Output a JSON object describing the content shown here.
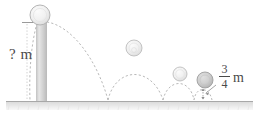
{
  "figure": {
    "type": "physics-diagram",
    "labels": {
      "drop_height": "? m",
      "drop_height_text": "?",
      "drop_height_unit": "m",
      "bounce_height_numerator": "3",
      "bounce_height_denominator": "4",
      "bounce_height_unit": "m"
    },
    "colors": {
      "ball_fill": "#f2f2f2",
      "ball_fill_dark": "#c9c9c9",
      "ball_stroke": "#b5b5b5",
      "column_fill": "#d4d4d4",
      "ground_line": "#a8a8a8",
      "trajectory": "#b0b0b0",
      "text": "#4a4a4a"
    },
    "balls": [
      {
        "name": "ball-drop-start",
        "cx": 40,
        "cy": 15,
        "r": 10,
        "shade": "light"
      },
      {
        "name": "ball-bounce-1-apex",
        "cx": 134,
        "cy": 48,
        "r": 8,
        "shade": "light"
      },
      {
        "name": "ball-bounce-2-apex",
        "cx": 180,
        "cy": 74,
        "r": 7,
        "shade": "light"
      },
      {
        "name": "ball-bounce-3-apex",
        "cx": 205,
        "cy": 80,
        "r": 8,
        "shade": "dark"
      }
    ],
    "ground": {
      "y": 101,
      "x_start": 6,
      "x_end": 253
    },
    "column": {
      "x": 36,
      "y_top": 22,
      "width": 11,
      "height": 79
    }
  }
}
